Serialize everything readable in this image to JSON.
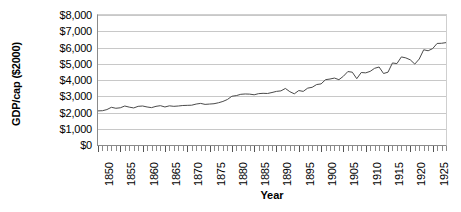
{
  "chart_data": {
    "type": "line",
    "title": "",
    "xlabel": "Year",
    "ylabel": "GDP/cap ($2000)",
    "ylim": [
      0,
      8000
    ],
    "xlim": [
      1850,
      1928
    ],
    "grid": true,
    "legend": "none",
    "y_ticks": [
      0,
      1000,
      2000,
      3000,
      4000,
      5000,
      6000,
      7000,
      8000
    ],
    "y_tick_labels": [
      "$0",
      "$1,000",
      "$2,000",
      "$3,000",
      "$4,000",
      "$5,000",
      "$6,000",
      "$7,000",
      "$8,000"
    ],
    "x_ticks": [
      1850,
      1855,
      1860,
      1865,
      1870,
      1875,
      1880,
      1885,
      1890,
      1895,
      1900,
      1905,
      1910,
      1915,
      1920,
      1925
    ],
    "x_tick_labels": [
      "1850",
      "1855",
      "1860",
      "1865",
      "1870",
      "1875",
      "1880",
      "1885",
      "1890",
      "1895",
      "1900",
      "1905",
      "1910",
      "1915",
      "1920",
      "1925"
    ],
    "series": [
      {
        "name": "GDP per capita",
        "color": "#4a4a4a",
        "x": [
          1850,
          1851,
          1852,
          1853,
          1854,
          1855,
          1856,
          1857,
          1858,
          1859,
          1860,
          1861,
          1862,
          1863,
          1864,
          1865,
          1866,
          1867,
          1868,
          1869,
          1870,
          1871,
          1872,
          1873,
          1874,
          1875,
          1876,
          1877,
          1878,
          1879,
          1880,
          1881,
          1882,
          1883,
          1884,
          1885,
          1886,
          1887,
          1888,
          1889,
          1890,
          1891,
          1892,
          1893,
          1894,
          1895,
          1896,
          1897,
          1898,
          1899,
          1900,
          1901,
          1902,
          1903,
          1904,
          1905,
          1906,
          1907,
          1908,
          1909,
          1910,
          1911,
          1912,
          1913,
          1914,
          1915,
          1916,
          1917,
          1918,
          1919,
          1920,
          1921,
          1922,
          1923,
          1924,
          1925,
          1926,
          1927,
          1928
        ],
        "values": [
          2100,
          2110,
          2180,
          2320,
          2260,
          2290,
          2400,
          2330,
          2280,
          2380,
          2400,
          2340,
          2300,
          2380,
          2420,
          2340,
          2410,
          2380,
          2400,
          2430,
          2440,
          2450,
          2520,
          2560,
          2500,
          2520,
          2540,
          2600,
          2680,
          2800,
          3000,
          3040,
          3120,
          3140,
          3130,
          3090,
          3160,
          3180,
          3170,
          3230,
          3300,
          3330,
          3480,
          3280,
          3150,
          3350,
          3300,
          3500,
          3550,
          3720,
          3760,
          4020,
          4060,
          4120,
          4020,
          4230,
          4520,
          4480,
          4080,
          4460,
          4440,
          4530,
          4720,
          4800,
          4400,
          4480,
          5050,
          5010,
          5420,
          5360,
          5240,
          4980,
          5290,
          5860,
          5800,
          5930,
          6250,
          6260,
          6300
        ],
        "start_value": 2100,
        "end_value": 7000,
        "notes": [
          {
            "label": "Civil War era plateau",
            "x_range": [
              1861,
              1865
            ]
          },
          {
            "label": "Panic of 1893 depression",
            "x_range": [
              1893,
              1896
            ]
          },
          {
            "label": "Depression of 1920-21",
            "x_range": [
              1920,
              1921
            ]
          }
        ]
      }
    ]
  }
}
